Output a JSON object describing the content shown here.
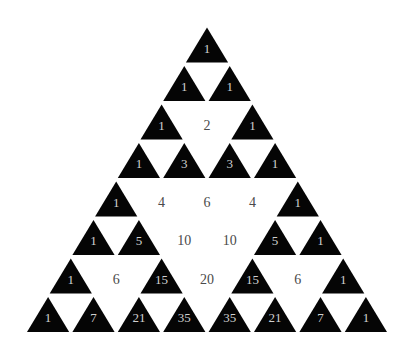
{
  "diagram": {
    "rows": [
      [
        1
      ],
      [
        1,
        1
      ],
      [
        1,
        2,
        1
      ],
      [
        1,
        3,
        3,
        1
      ],
      [
        1,
        4,
        6,
        4,
        1
      ],
      [
        1,
        5,
        10,
        10,
        5,
        1
      ],
      [
        1,
        6,
        15,
        20,
        15,
        6,
        1
      ],
      [
        1,
        7,
        21,
        35,
        35,
        21,
        7,
        1
      ]
    ],
    "colors": {
      "background": "#ffffff",
      "odd_cell_fill": "#050505",
      "odd_text": "#d0d0d0",
      "even_text": "#4a4a4a"
    },
    "legend": {
      "odd": "black triangle",
      "even": "white (empty) cell"
    }
  }
}
